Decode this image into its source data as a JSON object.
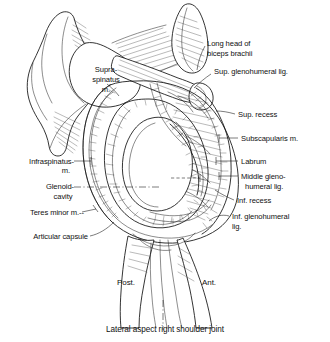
{
  "figure": {
    "title": "Lateral aspect right shoulder joint",
    "caption": "Lateral aspect right shoulder joint",
    "view": "Lateral aspect, right shoulder joint",
    "ink_color": "#111111",
    "background_color": "#ffffff"
  },
  "labels_left": [
    {
      "id": "supraspinatus",
      "lines": [
        "Supra-",
        "spinatus",
        "m."
      ],
      "x": 84,
      "y": 72,
      "align": "middle"
    },
    {
      "id": "infraspinatus",
      "lines": [
        "Infraspinatus-",
        "m."
      ],
      "x": 72,
      "y": 163,
      "align": "end"
    },
    {
      "id": "glenoid-cavity",
      "lines": [
        "Glenoid-",
        "cavity"
      ],
      "x": 72,
      "y": 188,
      "align": "end"
    },
    {
      "id": "teres-minor",
      "lines": [
        "Teres minor m.--"
      ],
      "x": 80,
      "y": 214,
      "align": "end"
    },
    {
      "id": "articular-capsule",
      "lines": [
        "Articular capsule"
      ],
      "x": 88,
      "y": 238,
      "align": "end"
    }
  ],
  "labels_right": [
    {
      "id": "long-head-biceps",
      "lines": [
        "Long head of",
        "biceps brachii"
      ],
      "x": 207,
      "y": 49
    },
    {
      "id": "sup-glenohumeral-lig",
      "lines": [
        "Sup. glenohumeral lig."
      ],
      "x": 213,
      "y": 77
    },
    {
      "id": "sup-recess",
      "lines": [
        "Sup. recess"
      ],
      "x": 237,
      "y": 116
    },
    {
      "id": "subscapularis",
      "lines": [
        "Subscapularis m."
      ],
      "x": 240,
      "y": 140
    },
    {
      "id": "labrum",
      "lines": [
        "Labrum"
      ],
      "x": 240,
      "y": 163
    },
    {
      "id": "middle-glenohumeral-lig",
      "lines": [
        "Middle gleno-",
        "humeral lig."
      ],
      "x": 240,
      "y": 178
    },
    {
      "id": "inf-recess",
      "lines": [
        "Inf. recess"
      ],
      "x": 236,
      "y": 202
    },
    {
      "id": "inf-glenohumeral-lig",
      "lines": [
        "Inf. glenohumeral",
        "lig."
      ],
      "x": 231,
      "y": 218
    }
  ],
  "orientation": [
    {
      "id": "posterior",
      "text": "Post.",
      "x": 117,
      "y": 283
    },
    {
      "id": "anterior",
      "text": "Ant.",
      "x": 205,
      "y": 283
    }
  ],
  "structures": [
    "scapula",
    "acromion",
    "coracoid process",
    "supraspinatus muscle",
    "infraspinatus muscle",
    "teres minor muscle",
    "subscapularis muscle",
    "glenoid cavity",
    "glenoid labrum",
    "articular capsule",
    "long head of biceps brachii tendon",
    "superior glenohumeral ligament",
    "middle glenohumeral ligament",
    "inferior glenohumeral ligament",
    "superior recess",
    "inferior recess",
    "humerus"
  ]
}
